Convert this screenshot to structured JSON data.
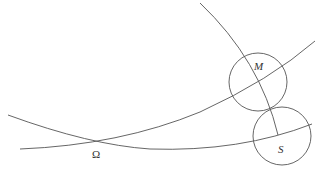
{
  "diagram": {
    "labels": {
      "omega": "Ω",
      "m": "M",
      "s": "S"
    },
    "circles": [
      {
        "name": "M",
        "cx": 258,
        "cy": 82,
        "r": 29
      },
      {
        "name": "S",
        "cx": 282,
        "cy": 136,
        "r": 29
      }
    ],
    "stroke_color": "#555555"
  }
}
